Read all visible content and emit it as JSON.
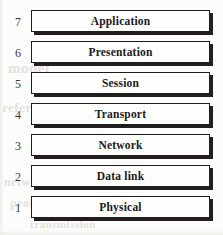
{
  "diagram": {
    "layers": [
      {
        "number": "7",
        "label": "Application"
      },
      {
        "number": "6",
        "label": "Presentation"
      },
      {
        "number": "5",
        "label": "Session"
      },
      {
        "number": "4",
        "label": "Transport"
      },
      {
        "number": "3",
        "label": "Network"
      },
      {
        "number": "2",
        "label": "Data link"
      },
      {
        "number": "1",
        "label": "Physical"
      }
    ],
    "colors": {
      "page_background": "#fcfcfb",
      "box_fill": "#fdfdfc",
      "box_border": "#1d1d1d",
      "box_shadow": "#231f1e",
      "label_text": "#1a1a1a",
      "number_text": "#3a3a3a",
      "bleed_through": "#e4e2dc"
    }
  },
  "background_bleed": {
    "line_1": "model",
    "line_2": "reference",
    "line_3": "network sub",
    "line_4": "protocol layers",
    "line_5": "transmission"
  }
}
